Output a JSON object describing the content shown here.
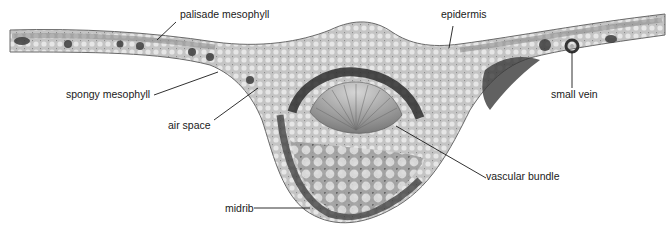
{
  "figure": {
    "labels": [
      {
        "id": "palisade",
        "text": "palisade mesophyll",
        "x": 180,
        "y": 14
      },
      {
        "id": "spongy",
        "text": "spongy mesophyll",
        "x": 66,
        "y": 93
      },
      {
        "id": "airspace",
        "text": "air space",
        "x": 168,
        "y": 123
      },
      {
        "id": "epidermis",
        "text": "epidermis",
        "x": 441,
        "y": 14
      },
      {
        "id": "smallvein",
        "text": "small vein",
        "x": 551,
        "y": 93
      },
      {
        "id": "vascular",
        "text": "vascular bundle",
        "x": 485,
        "y": 171
      },
      {
        "id": "midrib",
        "text": "midrib",
        "x": 225,
        "y": 203
      }
    ],
    "colors": {
      "tissue_light": "#c9c9c9",
      "tissue_mid": "#9a9a9a",
      "tissue_dark": "#3c3c3c",
      "leader_line": "#1a1a1a",
      "label_text": "#1a1a1a"
    }
  }
}
